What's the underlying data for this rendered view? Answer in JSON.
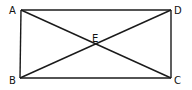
{
  "diagram": {
    "type": "rectangle-with-diagonals",
    "stroke_color": "#1a1a1a",
    "points": {
      "A": {
        "label": "A",
        "x": 21,
        "y": 10
      },
      "B": {
        "label": "B",
        "x": 20,
        "y": 78
      },
      "C": {
        "label": "C",
        "x": 171,
        "y": 78
      },
      "D": {
        "label": "D",
        "x": 171,
        "y": 10
      },
      "E": {
        "label": "E",
        "x": 96,
        "y": 44
      }
    },
    "segments": [
      "AD",
      "DC",
      "CB",
      "BA",
      "AC",
      "BD"
    ],
    "labels": [
      {
        "id": "A",
        "text": "A"
      },
      {
        "id": "B",
        "text": "B"
      },
      {
        "id": "C",
        "text": "C"
      },
      {
        "id": "D",
        "text": "D"
      },
      {
        "id": "E",
        "text": "E"
      }
    ]
  }
}
